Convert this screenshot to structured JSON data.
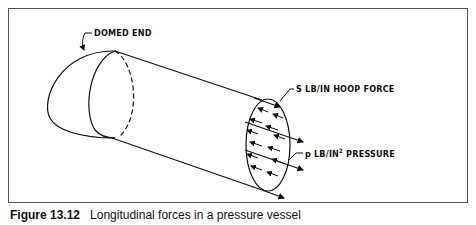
{
  "figure": {
    "labels": {
      "domed_end": "DOMED END",
      "hoop_force": "S LB/IN HOOP FORCE",
      "pressure_prefix": "p LB/IN",
      "pressure_sup": "2",
      "pressure_suffix": " PRESSURE"
    },
    "caption": {
      "number": "Figure 13.12",
      "title": "Longitudinal forces in a pressure vessel"
    },
    "colors": {
      "ink": "#111111",
      "border": "#555555",
      "background": "#ffffff"
    }
  }
}
